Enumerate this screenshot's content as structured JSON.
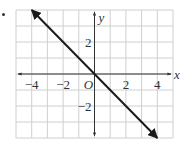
{
  "chart_data": {
    "type": "line",
    "title": "",
    "xlabel": "x",
    "ylabel": "y",
    "origin_label": "O",
    "xlim": [
      -5,
      5
    ],
    "ylim": [
      -4,
      4
    ],
    "grid": true,
    "x_ticks": [
      -4,
      -2,
      2,
      4
    ],
    "y_ticks": [
      2,
      -2
    ],
    "x_tick_labels": [
      "−4",
      "−2",
      "2",
      "4"
    ],
    "y_tick_labels": [
      "2",
      "−2"
    ],
    "series": [
      {
        "name": "y = -x",
        "equation": "y = -x",
        "points": [
          [
            -4,
            4
          ],
          [
            4,
            -4
          ]
        ],
        "arrows": "both"
      }
    ],
    "colors": {
      "line": "#1a1a1a",
      "grid": "#cfcfcf",
      "axis": "#333333"
    }
  }
}
